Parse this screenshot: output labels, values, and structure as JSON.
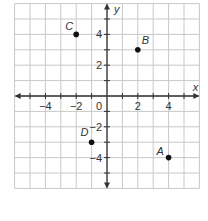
{
  "chart_data": {
    "type": "scatter",
    "title": "",
    "xlabel": "x",
    "ylabel": "y",
    "xlim": [
      -6,
      6
    ],
    "ylim": [
      -6,
      6
    ],
    "grid": true,
    "x_ticks": [
      "-4",
      "-2",
      "2",
      "4"
    ],
    "y_ticks": [
      "4",
      "2",
      "-2",
      "-4"
    ],
    "origin_label": "0",
    "points": [
      {
        "label": "A",
        "x": 4,
        "y": -4
      },
      {
        "label": "B",
        "x": 2,
        "y": 3
      },
      {
        "label": "C",
        "x": -2,
        "y": 4
      },
      {
        "label": "D",
        "x": -1,
        "y": -3
      }
    ]
  },
  "colors": {
    "grid": "#c8c8c8",
    "axis": "#333333",
    "point": "#111111"
  }
}
